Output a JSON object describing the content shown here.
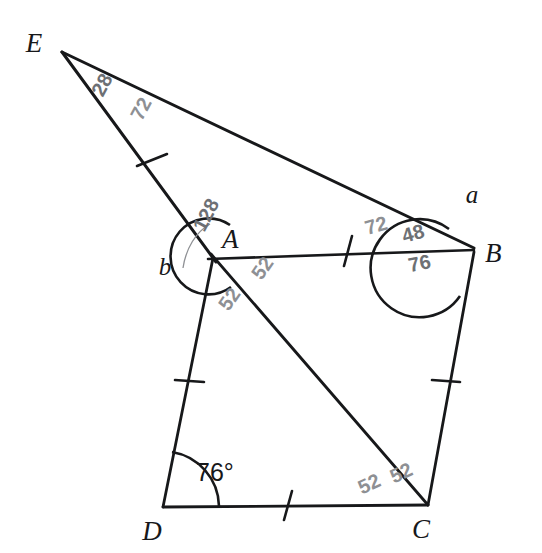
{
  "figure": {
    "title_visible": false,
    "background_color": "#ffffff",
    "ink_color": "#17181a",
    "pencil_color": "#8e9094"
  },
  "vertices": [
    {
      "id": "E",
      "label": "E",
      "x": 62,
      "y": 52,
      "label_x": 34,
      "label_y": 52
    },
    {
      "id": "A",
      "label": "A",
      "x": 213,
      "y": 253,
      "label_x": 222,
      "label_y": 248
    },
    {
      "id": "B",
      "label": "B",
      "x": 474,
      "y": 248,
      "label_x": 485,
      "label_y": 262
    },
    {
      "id": "C",
      "label": "C",
      "x": 428,
      "y": 505,
      "label_x": 421,
      "label_y": 538
    },
    {
      "id": "D",
      "label": "D",
      "x": 163,
      "y": 507,
      "label_x": 152,
      "label_y": 540
    }
  ],
  "segments": [
    {
      "id": "EB",
      "from": "E",
      "to": "B",
      "ticks": 0
    },
    {
      "id": "EA",
      "from": "E",
      "to": "A",
      "ticks": 1
    },
    {
      "id": "AB",
      "from": "A",
      "to": "B",
      "ticks": 1
    },
    {
      "id": "AD",
      "from": "A",
      "to": "D",
      "ticks": 1
    },
    {
      "id": "AC",
      "from": "A",
      "to": "C",
      "ticks": 0
    },
    {
      "id": "BC",
      "from": "B",
      "to": "C",
      "ticks": 1
    },
    {
      "id": "DC",
      "from": "D",
      "to": "C",
      "ticks": 1
    }
  ],
  "angle_labels": [
    {
      "id": "a",
      "text": "a",
      "x": 472,
      "y": 203,
      "kind": "variable"
    },
    {
      "id": "b",
      "text": "b",
      "x": 165,
      "y": 275,
      "kind": "variable"
    },
    {
      "id": "d",
      "text": "76°",
      "x": 196,
      "y": 481,
      "kind": "measure"
    }
  ],
  "annotations": [
    {
      "id": "ann-e-28",
      "text": "28",
      "x": 108,
      "y": 88,
      "rotation": -62,
      "shade": "dark"
    },
    {
      "id": "ann-e-72",
      "text": "72",
      "x": 147,
      "y": 112,
      "rotation": -62,
      "shade": "light"
    },
    {
      "id": "ann-a-128",
      "text": "128",
      "x": 212,
      "y": 218,
      "rotation": -62,
      "shade": "dark"
    },
    {
      "id": "ann-a-52-r",
      "text": "52",
      "x": 268,
      "y": 272,
      "rotation": -55,
      "shade": "light"
    },
    {
      "id": "ann-a-52-l",
      "text": "52",
      "x": 235,
      "y": 303,
      "rotation": -55,
      "shade": "light"
    },
    {
      "id": "ann-b-72",
      "text": "72",
      "x": 378,
      "y": 232,
      "rotation": -16,
      "shade": "light"
    },
    {
      "id": "ann-b-48",
      "text": "48",
      "x": 415,
      "y": 240,
      "rotation": -16,
      "shade": "dark"
    },
    {
      "id": "ann-b-76",
      "text": "76",
      "x": 421,
      "y": 270,
      "rotation": -12,
      "shade": "dark"
    },
    {
      "id": "ann-c-52-l",
      "text": "52",
      "x": 372,
      "y": 490,
      "rotation": -25,
      "shade": "light"
    },
    {
      "id": "ann-c-52-r",
      "text": "52",
      "x": 404,
      "y": 479,
      "rotation": -25,
      "shade": "light"
    }
  ],
  "arcs": [
    {
      "id": "arc-a-reflex",
      "at": "A",
      "type": "reflex"
    },
    {
      "id": "arc-b-reflex",
      "at": "B",
      "type": "reflex"
    },
    {
      "id": "arc-d",
      "at": "D",
      "type": "interior"
    }
  ]
}
